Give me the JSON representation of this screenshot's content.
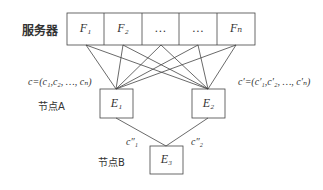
{
  "server": {
    "label": "服务器",
    "cells": [
      "F₁",
      "F₂",
      "…",
      "…",
      "Fₙ"
    ]
  },
  "nodes": {
    "e1": "E₁",
    "e2": "E₂",
    "e3": "E₃"
  },
  "labels": {
    "node_a": "节点A",
    "node_b": "节点B",
    "c_vector": "c=(c₁,c₂, …, cₙ)",
    "c_prime_vector": "c′=(c′₁,c′₂, …, c′ₙ)",
    "c1_double_prime": "c″₁",
    "c2_double_prime": "c″₂"
  }
}
